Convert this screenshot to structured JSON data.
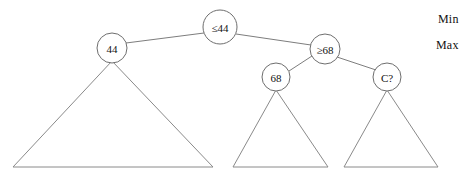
{
  "diagram": {
    "kind": "binary-search-tree-with-subtree-triangles",
    "background_color": "#ffffff",
    "line_color": "#7d7d7d",
    "text_color": "#111111",
    "nodes": [
      {
        "id": "root",
        "label": "≤44",
        "cx": 220,
        "cy": 27,
        "r": 17
      },
      {
        "id": "left",
        "label": "44",
        "cx": 112,
        "cy": 48,
        "r": 15
      },
      {
        "id": "right",
        "label": "≥68",
        "cx": 325,
        "cy": 49,
        "r": 15
      },
      {
        "id": "mid",
        "label": "68",
        "cx": 276,
        "cy": 77,
        "r": 14
      },
      {
        "id": "unknown",
        "label": "C?",
        "cx": 387,
        "cy": 77,
        "r": 14
      }
    ],
    "edges": [
      {
        "id": "root-to-left",
        "from": "root",
        "to": "left",
        "x1": 204,
        "y1": 33,
        "x2": 126,
        "y2": 43
      },
      {
        "id": "root-to-right",
        "from": "root",
        "to": "right",
        "x1": 236,
        "y1": 34,
        "x2": 311,
        "y2": 45
      },
      {
        "id": "right-to-mid",
        "from": "right",
        "to": "mid",
        "x1": 312,
        "y1": 56,
        "x2": 289,
        "y2": 71
      },
      {
        "id": "right-to-unknown",
        "from": "right",
        "to": "unknown",
        "x1": 337,
        "y1": 57,
        "x2": 376,
        "y2": 70
      }
    ],
    "triangles": [
      {
        "id": "subtree-left",
        "apex_x": 112,
        "apex_y": 61,
        "base_left_x": 13,
        "base_right_x": 213,
        "base_y": 167
      },
      {
        "id": "subtree-mid",
        "apex_x": 276,
        "apex_y": 90,
        "base_left_x": 233,
        "base_right_x": 328,
        "base_y": 167
      },
      {
        "id": "subtree-unknown",
        "apex_x": 387,
        "apex_y": 90,
        "base_left_x": 344,
        "base_right_x": 438,
        "base_y": 167
      }
    ],
    "level_labels": {
      "min": "Min",
      "max": "Max"
    }
  }
}
